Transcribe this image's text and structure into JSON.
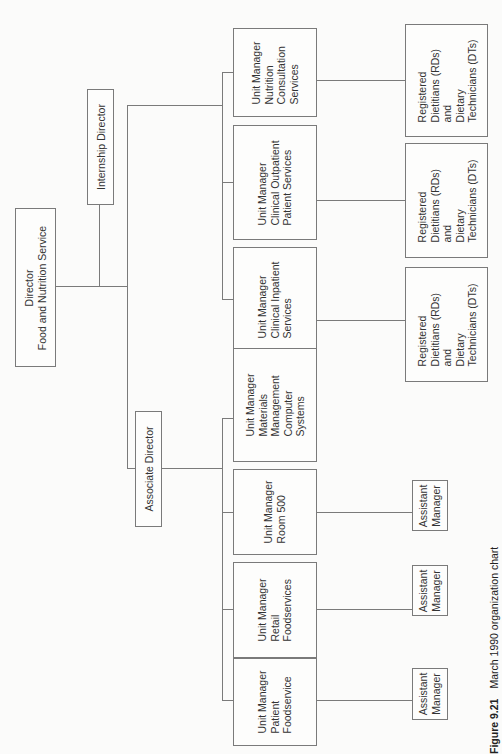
{
  "chart": {
    "title": "March 1990 organization chart",
    "figure_label": "Figure 9.21",
    "orientation": "rotated 90° counter-clockwise",
    "director": {
      "lines": [
        "Director",
        "Food and Nutrition Service"
      ]
    },
    "internship_director": {
      "lines": [
        "Internship Director"
      ]
    },
    "associate_director": {
      "lines": [
        "Associate Director"
      ]
    },
    "clinical_units": [
      {
        "lines": [
          "Unit Manager",
          "Nutrition",
          "Consultation",
          "Services"
        ],
        "staff": {
          "lines": [
            "Registered",
            "Dietitians (RDs)",
            "and",
            "Dietary",
            "Technicians (DTs)"
          ]
        }
      },
      {
        "lines": [
          "Unit Manager",
          "Clinical Outpatient",
          "Patient Services"
        ],
        "staff": {
          "lines": [
            "Registered",
            "Dietitians (RDs)",
            "and",
            "Dietary",
            "Technicians (DTs)"
          ]
        }
      },
      {
        "lines": [
          "Unit Manager",
          "Clinical Inpatient",
          "Services"
        ],
        "staff": {
          "lines": [
            "Registered",
            "Dietitians (RDs)",
            "and",
            "Dietary",
            "Technicians (DTs)"
          ]
        }
      }
    ],
    "operations_units": [
      {
        "lines": [
          "Unit Manager",
          "Materials",
          "Management",
          "Computer",
          "Systems"
        ]
      },
      {
        "lines": [
          "Unit Manager",
          "Room 500"
        ],
        "staff": {
          "lines": [
            "Assistant",
            "Manager"
          ]
        }
      },
      {
        "lines": [
          "Unit Manager",
          "Retail",
          "Foodservices"
        ],
        "staff": {
          "lines": [
            "Assistant",
            "Manager"
          ]
        }
      },
      {
        "lines": [
          "Unit Manager",
          "Patient",
          "Foodservice"
        ],
        "staff": {
          "lines": [
            "Assistant",
            "Manager"
          ]
        }
      }
    ]
  }
}
